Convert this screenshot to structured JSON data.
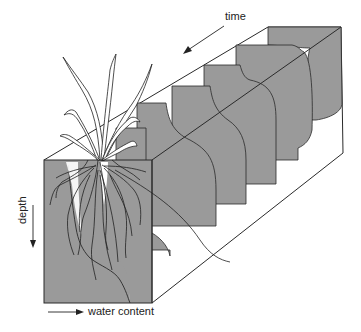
{
  "figure": {
    "type": "3D soil-profile diagram",
    "labels": {
      "time": "time",
      "depth": "depth",
      "water_content": "water content"
    },
    "axes": {
      "time_direction": "toward viewer (front-left)",
      "depth_direction": "downward",
      "water_content_direction": "rightward"
    },
    "panels_count": 6,
    "colors": {
      "soil_fill": "#9a9a9a",
      "outline": "#2a2a2a",
      "background": "#ffffff",
      "root_channel": "#ffffff"
    }
  }
}
